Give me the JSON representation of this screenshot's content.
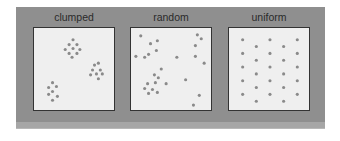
{
  "colors": {
    "frame": "#8f8f8f",
    "box": "#efefef",
    "dot": "#8a8a8a"
  },
  "panels": [
    {
      "label": "clumped",
      "points": [
        [
          40,
          12
        ],
        [
          36,
          17
        ],
        [
          44,
          17
        ],
        [
          32,
          22
        ],
        [
          40,
          21
        ],
        [
          47,
          22
        ],
        [
          36,
          26
        ],
        [
          44,
          26
        ],
        [
          39,
          30
        ],
        [
          62,
          38
        ],
        [
          66,
          36
        ],
        [
          60,
          43
        ],
        [
          68,
          43
        ],
        [
          64,
          47
        ],
        [
          58,
          48
        ],
        [
          70,
          47
        ],
        [
          66,
          52
        ],
        [
          19,
          56
        ],
        [
          15,
          61
        ],
        [
          23,
          60
        ],
        [
          19,
          65
        ],
        [
          15,
          68
        ],
        [
          24,
          70
        ],
        [
          19,
          74
        ]
      ]
    },
    {
      "label": "random",
      "points": [
        [
          10,
          8
        ],
        [
          68,
          7
        ],
        [
          72,
          11
        ],
        [
          20,
          16
        ],
        [
          27,
          13
        ],
        [
          66,
          18
        ],
        [
          18,
          27
        ],
        [
          26,
          23
        ],
        [
          5,
          29
        ],
        [
          14,
          30
        ],
        [
          47,
          30
        ],
        [
          66,
          29
        ],
        [
          75,
          36
        ],
        [
          31,
          42
        ],
        [
          24,
          48
        ],
        [
          28,
          51
        ],
        [
          17,
          57
        ],
        [
          25,
          56
        ],
        [
          36,
          57
        ],
        [
          56,
          53
        ],
        [
          14,
          62
        ],
        [
          22,
          63
        ],
        [
          18,
          67
        ],
        [
          27,
          66
        ],
        [
          70,
          69
        ],
        [
          64,
          79
        ]
      ]
    },
    {
      "label": "uniform",
      "points": [
        [
          14,
          12
        ],
        [
          42,
          12
        ],
        [
          70,
          12
        ],
        [
          28,
          19
        ],
        [
          56,
          19
        ],
        [
          14,
          26
        ],
        [
          42,
          26
        ],
        [
          70,
          26
        ],
        [
          28,
          33
        ],
        [
          56,
          33
        ],
        [
          14,
          40
        ],
        [
          42,
          40
        ],
        [
          70,
          40
        ],
        [
          28,
          47
        ],
        [
          56,
          47
        ],
        [
          14,
          54
        ],
        [
          42,
          54
        ],
        [
          70,
          54
        ],
        [
          28,
          61
        ],
        [
          56,
          61
        ],
        [
          14,
          68
        ],
        [
          42,
          68
        ],
        [
          70,
          68
        ],
        [
          28,
          75
        ],
        [
          56,
          75
        ]
      ]
    }
  ]
}
